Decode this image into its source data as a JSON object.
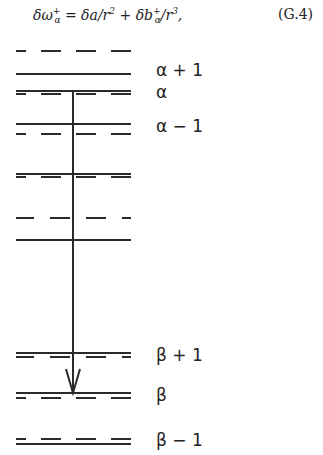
{
  "equation": {
    "lhs": "δω",
    "lhs_sup": "+",
    "lhs_sub": "α",
    "eq": " = δa/r",
    "r_exp1": "2",
    "plus": " + δb",
    "b_sup": "+",
    "b_sub": "α",
    "div": "/r",
    "r_exp2": "3",
    "tail": ",",
    "number": "(G.4)"
  },
  "diagram": {
    "line_color": "#2a2a2a",
    "labels": [
      {
        "text": "α + 1",
        "y": 60
      },
      {
        "text": "α",
        "y": 82
      },
      {
        "text": "α − 1",
        "y": 116
      },
      {
        "text": "β + 1",
        "y": 345
      },
      {
        "text": "β",
        "y": 385
      },
      {
        "text": "β − 1",
        "y": 430
      }
    ],
    "transition": {
      "from": "α",
      "to": "β",
      "direction": "down"
    }
  }
}
